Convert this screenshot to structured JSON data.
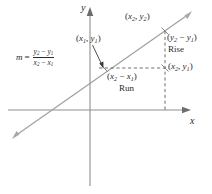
{
  "figure": {
    "axes": {
      "y_label": "y",
      "x_label": "x"
    },
    "slope_formula": {
      "variable": "m",
      "equals": "=",
      "numerator_left": "y",
      "numerator_left_sub": "2",
      "numerator_minus": " − ",
      "numerator_right": "y",
      "numerator_right_sub": "1",
      "denominator_left": "x",
      "denominator_left_sub": "2",
      "denominator_minus": " − ",
      "denominator_right": "x",
      "denominator_right_sub": "1"
    },
    "labels": {
      "point1": {
        "open": "(",
        "x": "x",
        "x_sub": "1",
        "comma": ", ",
        "y": "y",
        "y_sub": "1",
        "close": ")"
      },
      "point2": {
        "open": "(",
        "x": "x",
        "x_sub": "2",
        "comma": ", ",
        "y": "y",
        "y_sub": "2",
        "close": ")"
      },
      "point_corner": {
        "open": "(",
        "x": "x",
        "x_sub": "2",
        "comma": ", ",
        "y": "y",
        "y_sub": "1",
        "close": ")"
      },
      "rise_delta": {
        "open": "(",
        "left": "y",
        "left_sub": "2",
        "minus": " − ",
        "right": "y",
        "right_sub": "1",
        "close": ")"
      },
      "rise_text": "Rise",
      "run_delta": {
        "open": "(",
        "left": "x",
        "left_sub": "2",
        "minus": " − ",
        "right": "x",
        "right_sub": "1",
        "close": ")"
      },
      "run_text": "Run"
    },
    "colors": {
      "axis": "#8a8a8a",
      "line": "#9a9a9a",
      "dashed": "#6e6e6e",
      "text": "#2b2b2b",
      "background": "#ffffff"
    },
    "geometry": {
      "x_axis_y": 110,
      "y_axis_x": 90,
      "point1": [
        104,
        68
      ],
      "point2": [
        165,
        31
      ],
      "point_corner": [
        165,
        68
      ],
      "line_start": [
        13,
        137
      ],
      "line_end": [
        191,
        13
      ]
    }
  }
}
